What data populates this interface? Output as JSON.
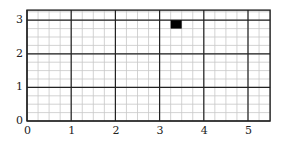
{
  "chart_data": {
    "type": "heatmap",
    "title": "",
    "xlabel": "",
    "ylabel": "",
    "xlim": [
      0,
      5.5
    ],
    "ylim": [
      0,
      3.3
    ],
    "grid": {
      "major_step": 1,
      "minor_step": 0.25,
      "visible": true
    },
    "x_ticks": [
      "0",
      "1",
      "2",
      "3",
      "4",
      "5"
    ],
    "y_ticks": [
      "0",
      "1",
      "2",
      "3"
    ],
    "filled_cells": [
      {
        "x0": 3.25,
        "x1": 3.5,
        "y0": 2.75,
        "y1": 3.0,
        "color": "#000000"
      }
    ],
    "legend": null
  },
  "colors": {
    "major_grid": "#222222",
    "minor_grid": "#c8c8c8",
    "fill": "#000000",
    "background": "#ffffff"
  }
}
